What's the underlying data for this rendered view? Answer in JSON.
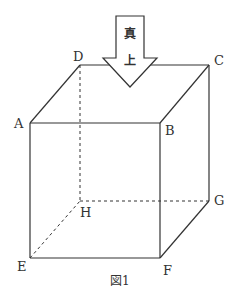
{
  "figure": {
    "caption": "図1",
    "arrow": {
      "label_top": "真",
      "label_bottom": "上"
    },
    "vertices": {
      "A": "A",
      "B": "B",
      "C": "C",
      "D": "D",
      "E": "E",
      "F": "F",
      "G": "G",
      "H": "H"
    },
    "line_color": "#333333"
  }
}
